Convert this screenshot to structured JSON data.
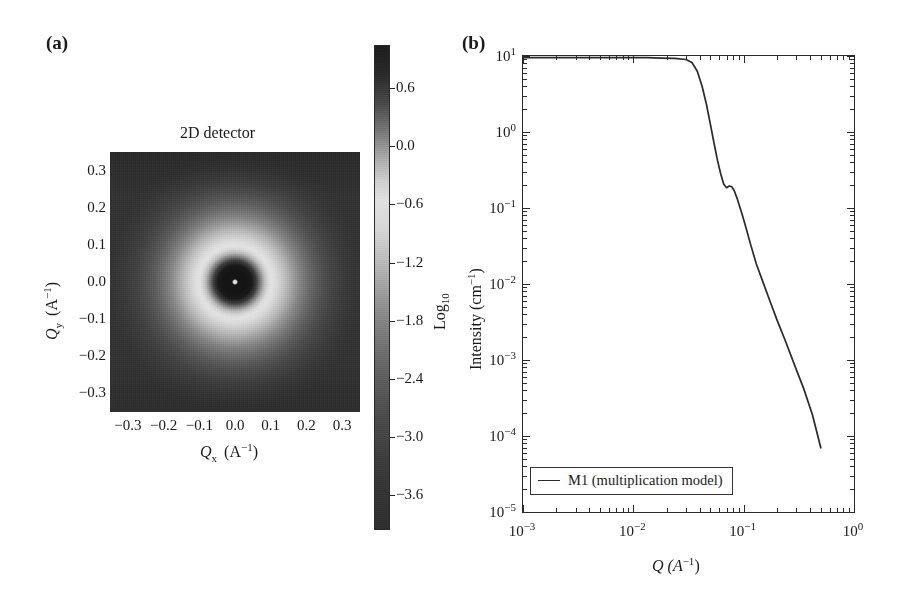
{
  "figure": {
    "panels": [
      {
        "tag": "(a)",
        "kind": "2d-detector-image"
      },
      {
        "tag": "(b)",
        "kind": "log-log-line-plot"
      }
    ]
  },
  "panel_a": {
    "tag": "(a)",
    "title": "2D detector",
    "xlabel_prefix": "Q",
    "xlabel_sub": "x",
    "xlabel_unit": "(A",
    "xlabel_exp": "−1",
    "xlabel_close": ")",
    "ylabel_prefix": "Q",
    "ylabel_sub": "y",
    "xticks": [
      "−0.3",
      "−0.2",
      "−0.1",
      "0.0",
      "0.1",
      "0.2",
      "0.3"
    ],
    "yticks": [
      "0.3",
      "0.2",
      "0.1",
      "0.0",
      "−0.1",
      "−0.2",
      "−0.3"
    ],
    "xlim": [
      -0.35,
      0.35
    ],
    "ylim": [
      -0.35,
      0.35
    ],
    "colorbar": {
      "label_main": "Log",
      "label_sub": "10",
      "ticks": [
        "0.6",
        "0.0",
        "−0.6",
        "−1.2",
        "−1.8",
        "−2.4",
        "−3.0",
        "−3.6"
      ],
      "vmin": -4.0,
      "vmax": 0.9
    }
  },
  "panel_b": {
    "tag": "(b)",
    "ylabel_text": "Intensity (cm",
    "ylabel_exp": "−1",
    "ylabel_close": ")",
    "xlabel_text": "Q (A",
    "xlabel_exp": "−1",
    "xlabel_close": ")",
    "xticks": [
      {
        "mant": "10",
        "exp": "−3"
      },
      {
        "mant": "10",
        "exp": "−2"
      },
      {
        "mant": "10",
        "exp": "−1"
      },
      {
        "mant": "10",
        "exp": "0"
      }
    ],
    "yticks": [
      {
        "mant": "10",
        "exp": "1"
      },
      {
        "mant": "10",
        "exp": "0"
      },
      {
        "mant": "10",
        "exp": "−1"
      },
      {
        "mant": "10",
        "exp": "−2"
      },
      {
        "mant": "10",
        "exp": "−3"
      },
      {
        "mant": "10",
        "exp": "−4"
      },
      {
        "mant": "10",
        "exp": "−5"
      }
    ],
    "legend": {
      "label": "M1 (multiplication model)"
    }
  },
  "colors": {
    "line": "#2a2a2a",
    "frame": "#2a2a2a",
    "text": "#1a1a1a",
    "background": "#ffffff"
  },
  "chart_data": {
    "type": "line",
    "title": "",
    "xlabel": "Q (A^-1)",
    "ylabel": "Intensity (cm^-1)",
    "xscale": "log",
    "yscale": "log",
    "xlim": [
      0.001,
      1.0
    ],
    "ylim": [
      1e-05,
      10
    ],
    "grid": false,
    "legend_position": "lower left",
    "series": [
      {
        "name": "M1 (multiplication model)",
        "x": [
          0.001,
          0.0013,
          0.0018,
          0.0024,
          0.0032,
          0.0042,
          0.0056,
          0.0075,
          0.01,
          0.0133,
          0.0178,
          0.0237,
          0.03,
          0.034,
          0.038,
          0.042,
          0.046,
          0.05,
          0.054,
          0.058,
          0.062,
          0.066,
          0.07,
          0.074,
          0.078,
          0.082,
          0.087,
          0.092,
          0.098,
          0.105,
          0.115,
          0.13,
          0.15,
          0.175,
          0.2,
          0.24,
          0.29,
          0.35,
          0.42,
          0.5
        ],
        "y": [
          9.5,
          9.5,
          9.5,
          9.5,
          9.5,
          9.5,
          9.5,
          9.5,
          9.5,
          9.5,
          9.4,
          9.3,
          9.0,
          8.2,
          6.3,
          4.0,
          2.3,
          1.25,
          0.7,
          0.42,
          0.28,
          0.205,
          0.185,
          0.195,
          0.19,
          0.17,
          0.135,
          0.105,
          0.078,
          0.055,
          0.034,
          0.0185,
          0.0105,
          0.0057,
          0.0034,
          0.00175,
          0.00085,
          0.00042,
          0.00019,
          7e-05
        ]
      }
    ]
  }
}
